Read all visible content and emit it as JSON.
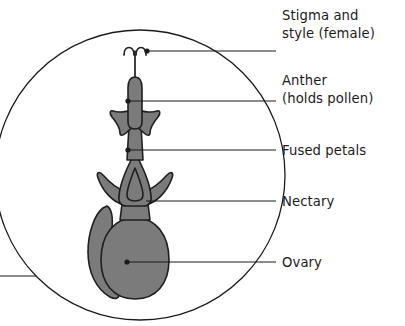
{
  "diagram": {
    "type": "botanical-cross-section",
    "colors": {
      "organ_fill": "#7b7b7b",
      "outline": "#1f1f1f",
      "text": "#1b1b1b",
      "background": "#ffffff",
      "leader": "#1b1b1b"
    },
    "magnifier": {
      "name": "magnified-circle",
      "cx": 140,
      "cy": 175,
      "r": 145
    },
    "labels": [
      {
        "id": "stigma-style",
        "lines": [
          "Stigma and",
          "style (female)"
        ],
        "line1": "Stigma and",
        "line2": "style (female)",
        "text_x": 282,
        "text_y": 20,
        "leader_y": 51,
        "leader_x_start": 146,
        "leader_x_end": 276,
        "has_dot": true,
        "dot_x": 147,
        "dot_y": 51
      },
      {
        "id": "anther",
        "lines": [
          "Anther",
          "(holds pollen)"
        ],
        "line1": "Anther",
        "line2": "(holds pollen)",
        "text_x": 282,
        "text_y": 85,
        "leader_y": 101,
        "leader_x_start": 128,
        "leader_x_end": 276,
        "has_dot": true,
        "dot_x": 128,
        "dot_y": 101
      },
      {
        "id": "fused-petals",
        "lines": [
          "Fused petals"
        ],
        "line1": "Fused petals",
        "line2": "",
        "text_x": 282,
        "text_y": 155,
        "leader_y": 150,
        "leader_x_start": 128,
        "leader_x_end": 276,
        "has_dot": true,
        "dot_x": 128,
        "dot_y": 150
      },
      {
        "id": "nectary",
        "lines": [
          "Nectary"
        ],
        "line1": "Nectary",
        "line2": "",
        "text_x": 282,
        "text_y": 206,
        "leader_y": 201,
        "leader_x_start": 146,
        "leader_x_end": 276,
        "has_dot": false,
        "dot_x": 146,
        "dot_y": 201
      },
      {
        "id": "ovary",
        "lines": [
          "Ovary"
        ],
        "line1": "Ovary",
        "line2": "",
        "text_x": 282,
        "text_y": 267,
        "leader_y": 262,
        "leader_x_start": 127,
        "leader_x_end": 276,
        "has_dot": true,
        "dot_x": 127,
        "dot_y": 262
      }
    ],
    "callout": {
      "name": "magnifier-connector",
      "x_start": 0,
      "x_end": 104,
      "y": 276
    },
    "parts": [
      {
        "id": "stigma",
        "name": "stigma"
      },
      {
        "id": "style",
        "name": "style"
      },
      {
        "id": "anther",
        "name": "anther"
      },
      {
        "id": "filament-tube",
        "name": "filament-tube"
      },
      {
        "id": "corolla-star",
        "name": "corolla-star"
      },
      {
        "id": "fused-petals",
        "name": "fused-petals"
      },
      {
        "id": "nectary",
        "name": "nectary"
      },
      {
        "id": "ovary",
        "name": "ovary"
      },
      {
        "id": "sepal",
        "name": "sepal"
      }
    ]
  }
}
